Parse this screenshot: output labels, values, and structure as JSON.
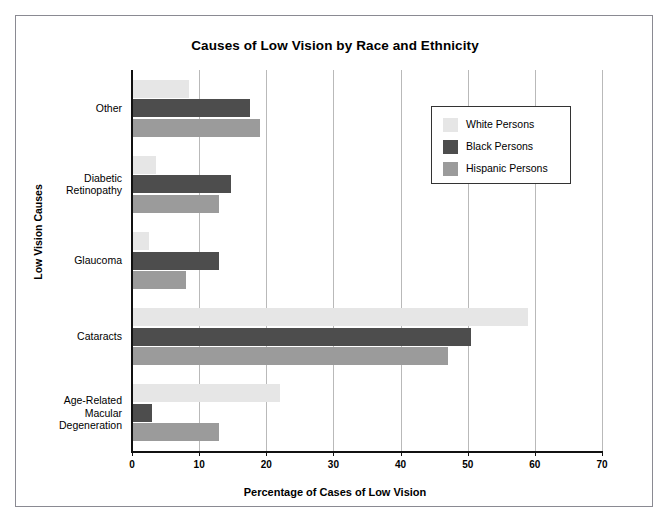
{
  "chart_data": {
    "type": "bar",
    "orientation": "horizontal",
    "title": "Causes of Low Vision by Race and Ethnicity",
    "xlabel": "Percentage of Cases of Low Vision",
    "ylabel": "Low Vision Causes",
    "xlim": [
      0,
      70
    ],
    "xticks": [
      0,
      10,
      20,
      30,
      40,
      50,
      60,
      70
    ],
    "xtick_labels": [
      "0",
      "10",
      "20",
      "30",
      "40",
      "50",
      "60",
      "70"
    ],
    "grid": "vertical",
    "legend_position": "upper right",
    "categories": [
      "Age-Related Macular Degeneration",
      "Cataracts",
      "Glaucoma",
      "Diabetic Retinopathy",
      "Other"
    ],
    "category_label_lines": [
      [
        "Age-Related",
        "Macular",
        "Degeneration"
      ],
      [
        "Cataracts"
      ],
      [
        "Glaucoma"
      ],
      [
        "Diabetic",
        "Retinopathy"
      ],
      [
        "Other"
      ]
    ],
    "series": [
      {
        "name": "White Persons",
        "color": "#e6e6e6",
        "values": [
          22,
          59,
          2.5,
          3.5,
          8.5
        ]
      },
      {
        "name": "Black Persons",
        "color": "#4d4d4d",
        "values": [
          3,
          50.5,
          13,
          14.8,
          17.5
        ]
      },
      {
        "name": "Hispanic Persons",
        "color": "#9b9b9b",
        "values": [
          13,
          47,
          8,
          13,
          19
        ]
      }
    ]
  },
  "legend": {
    "items": [
      {
        "label": "White Persons"
      },
      {
        "label": "Black Persons"
      },
      {
        "label": "Hispanic Persons"
      }
    ]
  }
}
